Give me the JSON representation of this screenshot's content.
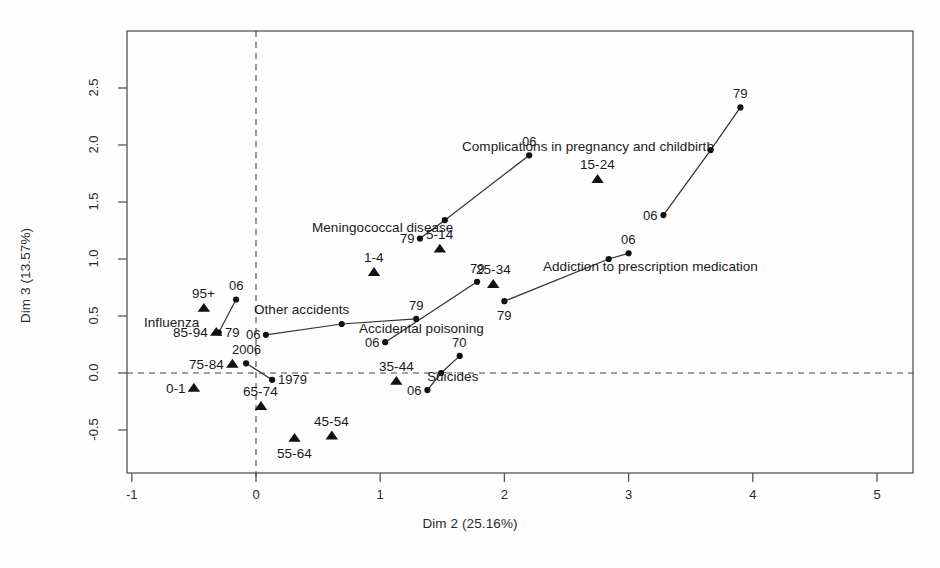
{
  "chart_data": {
    "type": "scatter",
    "title": "",
    "xlabel": "Dim 2 (25.16%)",
    "ylabel": "Dim 3 (13.57%)",
    "xlim": [
      -1.05,
      5.3
    ],
    "ylim": [
      -0.72,
      2.87
    ],
    "xticks": [
      -1,
      0,
      1,
      2,
      3,
      4,
      5
    ],
    "xticklabels": [
      "-1",
      "0",
      "1",
      "2",
      "3",
      "4",
      "5"
    ],
    "yticks": [
      -0.5,
      0.0,
      0.5,
      1.0,
      1.5,
      2.0,
      2.5
    ],
    "yticklabels": [
      "-0.5",
      "0.0",
      "0.5",
      "1.0",
      "1.5",
      "2.0",
      "2.5"
    ],
    "grid": false,
    "legend": "none",
    "reference_lines": [
      {
        "name": "vertical-zero-line",
        "orientation": "vertical",
        "value": 0,
        "style": "dashed"
      },
      {
        "name": "horizontal-zero-line",
        "orientation": "horizontal",
        "value": 0,
        "style": "dashed"
      }
    ],
    "marker_styles": {
      "supplementary_category": "filled-triangle",
      "trajectory_point": "filled-circle"
    },
    "age_groups": [
      {
        "label": "0-1",
        "x": -0.5,
        "y": -0.13,
        "marker": "triangle",
        "label_pos": "left"
      },
      {
        "label": "1-4",
        "x": 0.95,
        "y": 0.885,
        "marker": "triangle",
        "label_pos": "above"
      },
      {
        "label": "5-14",
        "x": 1.48,
        "y": 1.09,
        "marker": "triangle",
        "label_pos": "above"
      },
      {
        "label": "15-24",
        "x": 2.75,
        "y": 1.7,
        "marker": "triangle",
        "label_pos": "above"
      },
      {
        "label": "25-34",
        "x": 1.91,
        "y": 0.78,
        "marker": "triangle",
        "label_pos": "above"
      },
      {
        "label": "35-44",
        "x": 1.13,
        "y": -0.07,
        "marker": "triangle",
        "label_pos": "above"
      },
      {
        "label": "45-54",
        "x": 0.61,
        "y": -0.55,
        "marker": "triangle",
        "label_pos": "above"
      },
      {
        "label": "55-64",
        "x": 0.31,
        "y": -0.57,
        "marker": "triangle",
        "label_pos": "below"
      },
      {
        "label": "65-74",
        "x": 0.04,
        "y": -0.29,
        "marker": "triangle",
        "label_pos": "above"
      },
      {
        "label": "75-84",
        "x": -0.19,
        "y": 0.08,
        "marker": "triangle",
        "label_pos": "left"
      },
      {
        "label": "85-94",
        "x": -0.32,
        "y": 0.36,
        "marker": "triangle",
        "label_pos": "left"
      },
      {
        "label": "95+",
        "x": -0.42,
        "y": 0.57,
        "marker": "triangle",
        "label_pos": "above"
      }
    ],
    "trajectories": [
      {
        "name": "Influenza",
        "label_pos": {
          "x": -0.68,
          "y": 0.44
        },
        "points": [
          {
            "year": "79",
            "x": -0.3,
            "y": 0.355,
            "label": "79",
            "label_pos": "right"
          },
          {
            "year": "06",
            "x": -0.16,
            "y": 0.645,
            "label": "06",
            "label_pos": "above"
          }
        ]
      },
      {
        "name": "Other accidents",
        "label_pos": {
          "x": 0.37,
          "y": 0.56
        },
        "points": [
          {
            "year": "06",
            "x": 0.08,
            "y": 0.335,
            "label": "06",
            "label_pos": "left"
          },
          {
            "year": "mid",
            "x": 0.69,
            "y": 0.43,
            "label": "",
            "label_pos": "none"
          },
          {
            "year": "79",
            "x": 1.29,
            "y": 0.475,
            "label": "79",
            "label_pos": "above"
          }
        ]
      },
      {
        "name": "Accidental poisoning",
        "label_pos": {
          "x": 1.33,
          "y": 0.39
        },
        "points": [
          {
            "year": "06",
            "x": 1.04,
            "y": 0.27,
            "label": "06",
            "label_pos": "left"
          },
          {
            "year": "79",
            "x": 1.78,
            "y": 0.8,
            "label": "79",
            "label_pos": "above"
          }
        ]
      },
      {
        "name": "Suicides",
        "label_pos": {
          "x": 1.58,
          "y": -0.03
        },
        "points": [
          {
            "year": "06",
            "x": 1.38,
            "y": -0.15,
            "label": "06",
            "label_pos": "left"
          },
          {
            "year": "mid",
            "x": 1.49,
            "y": 0.0,
            "label": "",
            "label_pos": "none"
          },
          {
            "year": "70",
            "x": 1.64,
            "y": 0.15,
            "label": "70",
            "label_pos": "above"
          }
        ]
      },
      {
        "name": "Meningococcal disease",
        "label_pos": {
          "x": 1.02,
          "y": 1.28
        },
        "points": [
          {
            "year": "79",
            "x": 1.32,
            "y": 1.18,
            "label": "79",
            "label_pos": "left"
          },
          {
            "year": "mid",
            "x": 1.52,
            "y": 1.34,
            "label": "",
            "label_pos": "none"
          },
          {
            "year": "06",
            "x": 2.2,
            "y": 1.91,
            "label": "06",
            "label_pos": "above"
          }
        ]
      },
      {
        "name": "Addiction to prescription medication",
        "label_pos": {
          "x": 3.18,
          "y": 0.93
        },
        "points": [
          {
            "year": "79",
            "x": 2.0,
            "y": 0.63,
            "label": "79",
            "label_pos": "below"
          },
          {
            "year": "mid",
            "x": 2.84,
            "y": 1.0,
            "label": "",
            "label_pos": "none"
          },
          {
            "year": "06",
            "x": 3.0,
            "y": 1.05,
            "label": "06",
            "label_pos": "above"
          }
        ]
      },
      {
        "name": "Complications in pregnancy and childbirth",
        "label_pos": {
          "x": 2.67,
          "y": 1.99
        },
        "points": [
          {
            "year": "06",
            "x": 3.28,
            "y": 1.385,
            "label": "06",
            "label_pos": "left"
          },
          {
            "year": "mid",
            "x": 3.66,
            "y": 1.955,
            "label": "",
            "label_pos": "none"
          },
          {
            "year": "79",
            "x": 3.9,
            "y": 2.33,
            "label": "79",
            "label_pos": "above"
          }
        ]
      },
      {
        "name": "Years overall",
        "label_pos": null,
        "points": [
          {
            "year": "2006",
            "x": -0.08,
            "y": 0.085,
            "label": "2006",
            "label_pos": "above"
          },
          {
            "year": "1979",
            "x": 0.13,
            "y": -0.06,
            "label": "1979",
            "label_pos": "right"
          }
        ]
      }
    ]
  },
  "figure": {
    "background_color": "#fefefe",
    "axis_color": "#555555",
    "marker_color": "#111111",
    "line_color": "#333333",
    "text_color": "#1a1a1a"
  }
}
